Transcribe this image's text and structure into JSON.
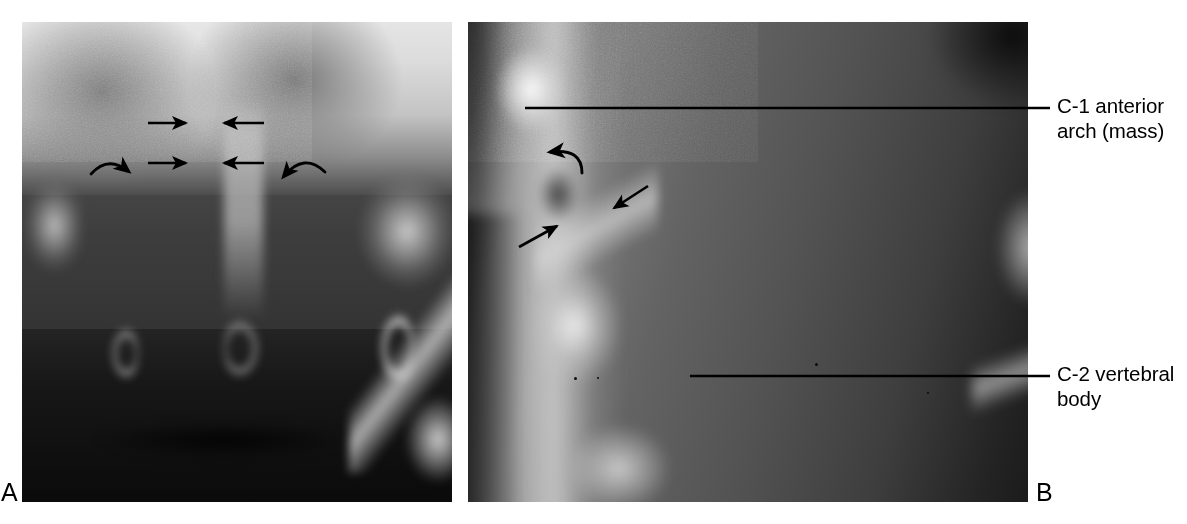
{
  "figure": {
    "background_color": "#ffffff",
    "width": 1187,
    "height": 524,
    "modality": "radiograph",
    "region": "cervical spine"
  },
  "panels": [
    {
      "letter": "A",
      "name": "open-mouth-odontoid-view",
      "x": 22,
      "y": 22,
      "width": 430,
      "height": 480,
      "letter_position": {
        "x": 1,
        "y": 478
      }
    },
    {
      "letter": "B",
      "name": "lateral-cervical-view",
      "x": 468,
      "y": 22,
      "width": 560,
      "height": 480,
      "letter_position": {
        "x": 1036,
        "y": 478
      }
    }
  ],
  "callouts": [
    {
      "id": "c1",
      "text": "C-1 anterior\narch (mass)",
      "line1": "C-1 anterior",
      "line2": "arch (mass)",
      "text_x": 1057,
      "text_y": 93,
      "leader_line": {
        "x1": 525,
        "y1": 108,
        "x2": 1050,
        "y2": 108
      }
    },
    {
      "id": "c2",
      "text": "C-2 vertebral\nbody",
      "line1": "C-2 vertebral",
      "line2": "body",
      "text_x": 1057,
      "text_y": 361,
      "leader_line": {
        "x1": 690,
        "y1": 376,
        "x2": 1050,
        "y2": 376
      }
    }
  ],
  "annotations": {
    "panel_a": [
      {
        "name": "arrow-right-upper",
        "type": "straight",
        "direction": "right",
        "x1": 148,
        "y1": 123,
        "x2": 190,
        "y2": 123
      },
      {
        "name": "arrow-left-upper",
        "type": "straight",
        "direction": "left",
        "x1": 262,
        "y1": 123,
        "x2": 220,
        "y2": 123
      },
      {
        "name": "arrow-right-lower",
        "type": "straight",
        "direction": "right",
        "x1": 148,
        "y1": 163,
        "x2": 190,
        "y2": 163
      },
      {
        "name": "arrow-left-lower",
        "type": "straight",
        "direction": "left",
        "x1": 262,
        "y1": 163,
        "x2": 220,
        "y2": 163
      },
      {
        "name": "curved-arrow-left",
        "type": "curved",
        "direction": "down-right"
      },
      {
        "name": "curved-arrow-right",
        "type": "curved",
        "direction": "down-left"
      }
    ],
    "panel_b": [
      {
        "name": "curved-arrow-c1-arch",
        "type": "curved",
        "direction": "up-left"
      },
      {
        "name": "arrow-diagonal-down-left",
        "type": "straight",
        "direction": "down-left"
      },
      {
        "name": "arrow-diagonal-up-right",
        "type": "straight",
        "direction": "up-right"
      }
    ]
  },
  "style": {
    "annotation_color": "#000000",
    "leader_line_color": "#000000",
    "text_color": "#000000",
    "label_font_size_px": 20.5,
    "panel_letter_font_size_px": 25
  }
}
